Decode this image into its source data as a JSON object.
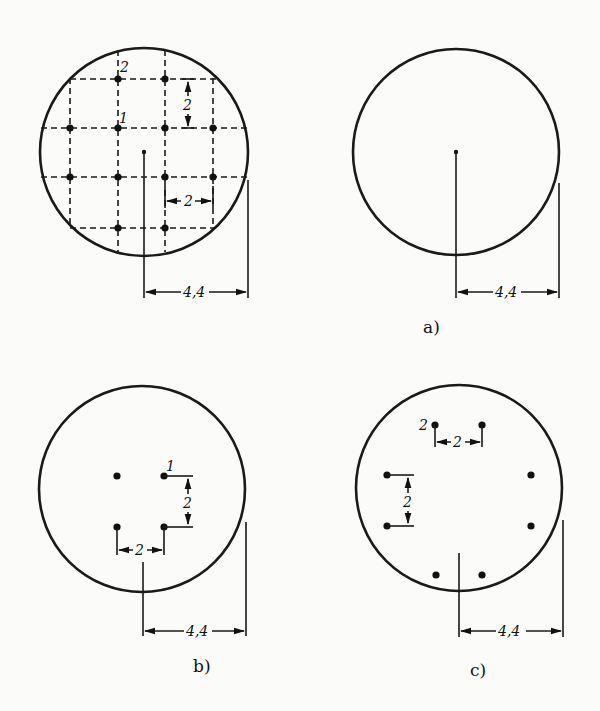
{
  "figure": {
    "panels": [
      {
        "id": "grid",
        "caption": "",
        "radius_label": "4,4",
        "spacing_label_h": "2",
        "spacing_label_v": "2",
        "point_labels": [
          "1",
          "2"
        ]
      },
      {
        "id": "a",
        "caption": "a)",
        "radius_label": "4,4"
      },
      {
        "id": "b",
        "caption": "b)",
        "radius_label": "4,4",
        "spacing_label_h": "2",
        "spacing_label_v": "2",
        "point_labels": [
          "1"
        ]
      },
      {
        "id": "c",
        "caption": "c)",
        "radius_label": "4,4",
        "spacing_label_h": "2",
        "spacing_label_v": "2",
        "point_labels": [
          "2"
        ]
      }
    ]
  }
}
